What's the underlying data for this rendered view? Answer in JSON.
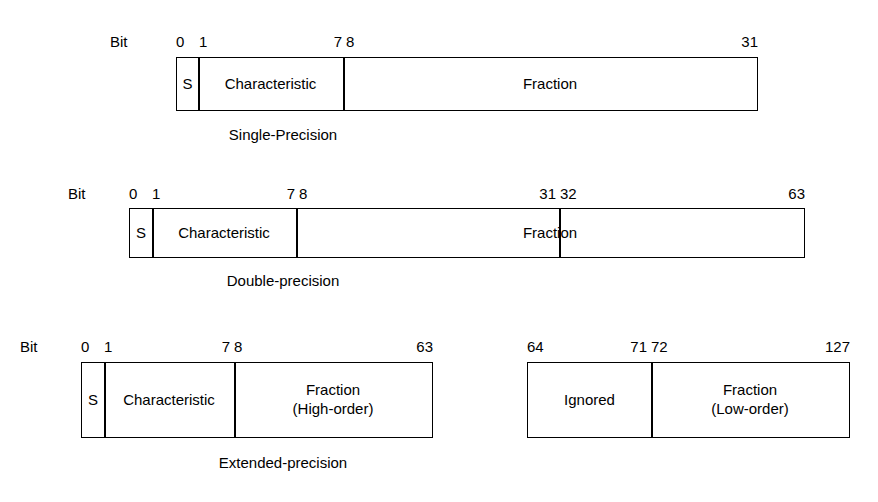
{
  "figure": {
    "bit_label": "Bit"
  },
  "formats": [
    {
      "name": "single-precision",
      "caption": "Single-Precision",
      "bit_label": "Bit",
      "boxes": [
        {
          "name": "single-precision-word",
          "ticks": [
            "0",
            "1",
            "7",
            "8",
            "31"
          ],
          "fields": [
            {
              "name": "sign",
              "label": "S"
            },
            {
              "name": "characteristic",
              "label": "Characteristic"
            },
            {
              "name": "fraction",
              "label": "Fraction"
            }
          ]
        }
      ]
    },
    {
      "name": "double-precision",
      "caption": "Double-precision",
      "bit_label": "Bit",
      "boxes": [
        {
          "name": "double-precision-word",
          "ticks": [
            "0",
            "1",
            "7",
            "8",
            "31",
            "32",
            "63"
          ],
          "fields": [
            {
              "name": "sign",
              "label": "S"
            },
            {
              "name": "characteristic",
              "label": "Characteristic"
            },
            {
              "name": "fraction",
              "label": "Fraction"
            }
          ]
        }
      ]
    },
    {
      "name": "extended-precision",
      "caption": "Extended-precision",
      "bit_label": "Bit",
      "boxes": [
        {
          "name": "extended-precision-high-word",
          "ticks": [
            "0",
            "1",
            "7",
            "8",
            "63"
          ],
          "fields": [
            {
              "name": "sign",
              "label": "S"
            },
            {
              "name": "characteristic",
              "label": "Characteristic"
            },
            {
              "name": "fraction-high-order",
              "label": "Fraction\n(High-order)"
            }
          ]
        },
        {
          "name": "extended-precision-low-word",
          "ticks": [
            "64",
            "71",
            "72",
            "127"
          ],
          "fields": [
            {
              "name": "ignored",
              "label": "Ignored"
            },
            {
              "name": "fraction-low-order",
              "label": "Fraction\n(Low-order)"
            }
          ]
        }
      ]
    }
  ]
}
